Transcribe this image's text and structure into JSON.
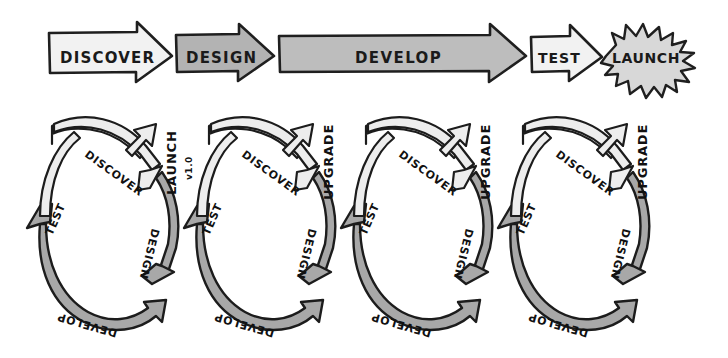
{
  "diagram": {
    "background_color": "#ffffff",
    "ink_color": "#1c1c1c",
    "palette": {
      "light_fill": "#e9e9e9",
      "mid_fill": "#b9b9b9",
      "dark_fill": "#a0a0a0",
      "white_fill": "#f6f6f6"
    }
  },
  "waterfall": {
    "name": "linear-waterfall-row",
    "steps": [
      {
        "label": "DISCOVER",
        "shape": "arrow",
        "fill": "light"
      },
      {
        "label": "DESIGN",
        "shape": "arrow",
        "fill": "mid"
      },
      {
        "label": "DEVELOP",
        "shape": "arrow",
        "fill": "mid"
      },
      {
        "label": "TEST",
        "shape": "arrow",
        "fill": "light"
      },
      {
        "label": "LAUNCH",
        "shape": "starburst",
        "fill": "light"
      }
    ]
  },
  "cycles": {
    "name": "iterative-cycles-row",
    "count": 4,
    "stages": [
      {
        "label": "DISCOVER",
        "fill": "light",
        "position": "top"
      },
      {
        "label": "DESIGN",
        "fill": "dark",
        "position": "right"
      },
      {
        "label": "DEVELOP",
        "fill": "dark",
        "position": "bottom"
      },
      {
        "label": "TEST",
        "fill": "light",
        "position": "left"
      }
    ],
    "items": [
      {
        "index": 1,
        "release_label": "LAUNCH",
        "release_sublabel": "v1.0"
      },
      {
        "index": 2,
        "release_label": "UPGRADE",
        "release_sublabel": ""
      },
      {
        "index": 3,
        "release_label": "UPGRADE",
        "release_sublabel": ""
      },
      {
        "index": 4,
        "release_label": "UPGRADE",
        "release_sublabel": ""
      }
    ]
  }
}
